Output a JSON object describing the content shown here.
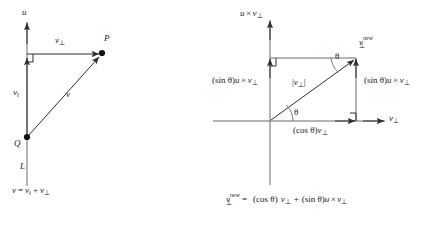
{
  "figure": {
    "stroke_color": "#3a3a3a",
    "text_color": "#1a1a1a",
    "background": "#ffffff"
  },
  "left_panel": {
    "axis_label_u": "u",
    "line_label_L": "L",
    "point_P": "P",
    "point_Q": "Q",
    "label_v_perp": "v",
    "label_v_perp_sub": "⊥",
    "label_v_parallel": "v",
    "label_v_parallel_sub": "‖",
    "label_v": "v",
    "caption_parts": {
      "v": "v",
      "eq": "=",
      "v_par": "v",
      "v_par_sub": "‖",
      "plus": "+",
      "v_perp": "v",
      "v_perp_sub": "⊥"
    },
    "caption_text": "v = v‖ + v⊥"
  },
  "right_panel": {
    "vertical_axis_label": {
      "u": "u",
      "times": "×",
      "v": "v",
      "v_sub": "⊥"
    },
    "horizontal_axis_label": {
      "v": "v",
      "v_sub": "⊥"
    },
    "vector_new_label": {
      "v": "v",
      "sup": "new",
      "sub": "⊥"
    },
    "hypotenuse_label": {
      "open": "|",
      "v": "v",
      "v_sub": "⊥",
      "close": "|"
    },
    "left_side_label": {
      "sin": "(sin θ)",
      "u": "u",
      "times": "×",
      "v": "v",
      "v_sub": "⊥"
    },
    "right_side_label": {
      "sin": "(sin θ)",
      "u": "u",
      "times": "×",
      "v": "v",
      "v_sub": "⊥"
    },
    "bottom_side_label": {
      "cos": "(cos θ)",
      "v": "v",
      "v_sub": "⊥"
    },
    "angle_origin": "θ",
    "angle_top": "θ",
    "equation": {
      "lhs_v": "v",
      "lhs_sup": "new",
      "lhs_sub": "⊥",
      "eq": "=",
      "cos": "(cos θ)",
      "v1": "v",
      "v1_sub": "⊥",
      "plus": "+",
      "sin": "(sin θ)",
      "u": "u",
      "times": "×",
      "v2": "v",
      "v2_sub": "⊥"
    },
    "equation_text": "v⊥new = (cos θ) v⊥ + (sin θ)u × v⊥"
  }
}
